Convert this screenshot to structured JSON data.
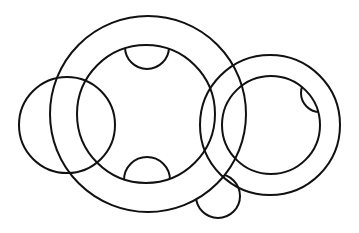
{
  "diagram": {
    "width": 359,
    "height": 233,
    "background": "#ffffff",
    "stroke_color": "#111111",
    "stroke_width": 2,
    "shapes": {
      "main_outer": {
        "cx": 148,
        "cy": 114,
        "r": 98
      },
      "main_inner": {
        "cx": 146,
        "cy": 114,
        "r": 69
      },
      "left_circle": {
        "cx": 67,
        "cy": 125,
        "r": 48
      },
      "right_outer": {
        "cx": 270,
        "cy": 125,
        "r": 70
      },
      "right_inner": {
        "cx": 271,
        "cy": 125,
        "r": 49
      },
      "bottom_small": {
        "cx": 218,
        "cy": 196,
        "r": 22
      },
      "top_semicircle": {
        "cx": 147,
        "cy": 47,
        "r": 22
      },
      "bottom_semicircle": {
        "cx": 147,
        "cy": 180,
        "r": 23
      },
      "right_lens": {
        "cx": 320,
        "cy": 93,
        "r": 19
      }
    }
  }
}
